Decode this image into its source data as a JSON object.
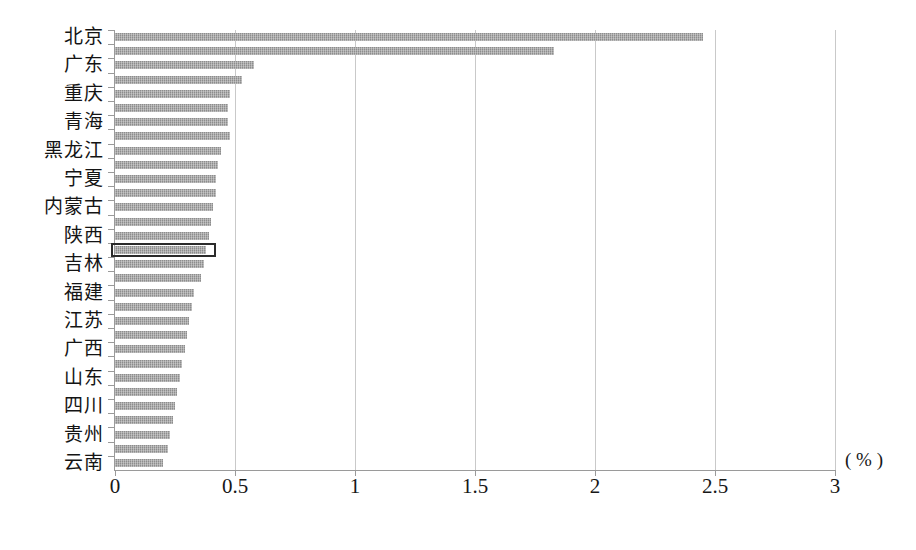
{
  "chart_data": {
    "type": "bar",
    "orientation": "horizontal",
    "title": "",
    "subtitle": "",
    "xlabel": "( % )",
    "ylabel": "",
    "xlim": [
      0,
      3
    ],
    "xticks": [
      "0",
      "0.5",
      "1",
      "1.5",
      "2",
      "2.5",
      "3"
    ],
    "xtick_values": [
      0,
      0.5,
      1,
      1.5,
      2,
      2.5,
      3
    ],
    "grid": "vertical",
    "legend": "none",
    "unit": "%",
    "bar_color": "#8d8d8d",
    "highlight_color": "#2b2b2b",
    "highlighted_category": "吉林",
    "categories": [
      "北京",
      "天津",
      "广东",
      "上海",
      "重庆",
      "新疆",
      "青海",
      "甘肃",
      "黑龙江",
      "海南",
      "宁夏",
      "辽宁",
      "内蒙古",
      "吉林",
      "陕西",
      "湖北",
      "吉林",
      "浙江",
      "福建",
      "河北",
      "江苏",
      "山西",
      "广西",
      "湖南",
      "山东",
      "江西",
      "四川",
      "河南",
      "贵州",
      "云南",
      "安徽"
    ],
    "labels_shown": [
      "北京",
      "广东",
      "重庆",
      "青海",
      "黑龙江",
      "宁夏",
      "内蒙古",
      "陕西",
      "吉林",
      "福建",
      "江苏",
      "广西",
      "山东",
      "四川",
      "贵州",
      "云南",
      "安徽"
    ],
    "values": [
      2.45,
      1.83,
      0.58,
      0.53,
      0.48,
      0.47,
      0.47,
      0.48,
      0.44,
      0.43,
      0.42,
      0.42,
      0.41,
      0.4,
      0.39,
      0.38,
      0.37,
      0.36,
      0.33,
      0.32,
      0.31,
      0.3,
      0.29,
      0.28,
      0.27,
      0.26,
      0.25,
      0.24,
      0.23,
      0.22,
      0.2
    ]
  },
  "axis": {
    "unit_text": "( % )"
  }
}
